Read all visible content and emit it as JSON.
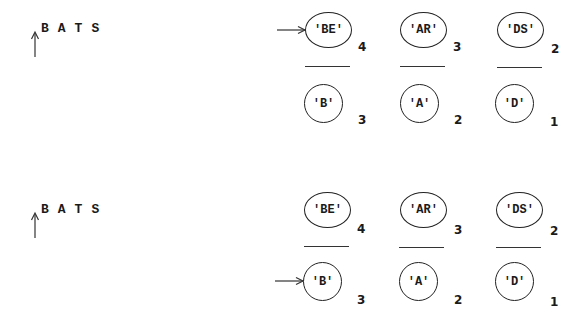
{
  "panels": [
    {
      "word": "BATS",
      "pointer_target": "top-row-first",
      "top_row": [
        {
          "label": "'BE'",
          "count": "4"
        },
        {
          "label": "'AR'",
          "count": "3"
        },
        {
          "label": "'DS'",
          "count": "2"
        }
      ],
      "bottom_row": [
        {
          "label": "'B'",
          "count": "3"
        },
        {
          "label": "'A'",
          "count": "2"
        },
        {
          "label": "'D'",
          "count": "1"
        }
      ]
    },
    {
      "word": "BATS",
      "pointer_target": "bottom-row-first",
      "top_row": [
        {
          "label": "'BE'",
          "count": "4"
        },
        {
          "label": "'AR'",
          "count": "3"
        },
        {
          "label": "'DS'",
          "count": "2"
        }
      ],
      "bottom_row": [
        {
          "label": "'B'",
          "count": "3"
        },
        {
          "label": "'A'",
          "count": "2"
        },
        {
          "label": "'D'",
          "count": "1"
        }
      ]
    }
  ]
}
